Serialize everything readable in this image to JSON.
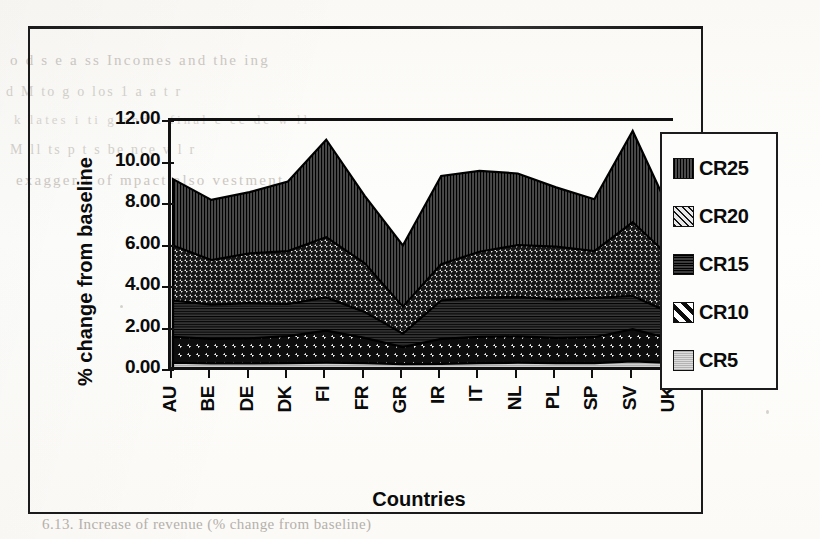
{
  "page": {
    "background_color": "#fdfdfb",
    "frame_color": "#1b1b1b",
    "caption": "6.13. Increase of revenue (% change from baseline)",
    "bleed_lines": [
      "o d s e a ss Incomes and the   ing",
      "d  M  to     g   o      los 1 a  a     t  r",
      "k  lates   i  ti g  and  t  final c ec  de  w ll",
      "M    ll    ts  p  t  s  be  nce   v   l  r",
      "exagger  t  of  mpact     also   vestment"
    ]
  },
  "chart_data": {
    "type": "area",
    "stacked": true,
    "title": "",
    "xlabel": "Countries",
    "ylabel": "% change from baseline",
    "categories": [
      "AU",
      "BE",
      "DE",
      "DK",
      "FI",
      "FR",
      "GR",
      "IR",
      "IT",
      "NL",
      "PL",
      "SP",
      "SV",
      "UK"
    ],
    "ylim": [
      0,
      12
    ],
    "yticks": [
      "0.00",
      "2.00",
      "4.00",
      "6.00",
      "8.00",
      "10.00",
      "12.00"
    ],
    "ytick_values": [
      0,
      2,
      4,
      6,
      8,
      10,
      12
    ],
    "grid": false,
    "legend_position": "right",
    "series": [
      {
        "name": "CR5",
        "color": "#c9c9c9",
        "pattern": "light-gray-dots",
        "values": [
          0.35,
          0.32,
          0.32,
          0.33,
          0.35,
          0.33,
          0.28,
          0.3,
          0.33,
          0.35,
          0.33,
          0.33,
          0.42,
          0.34
        ]
      },
      {
        "name": "CR10",
        "color": "#ffffff",
        "pattern": "bold-diagonal-stripes",
        "values": [
          1.25,
          1.18,
          1.2,
          1.3,
          1.55,
          1.22,
          0.82,
          1.2,
          1.27,
          1.27,
          1.22,
          1.25,
          1.55,
          1.15
        ]
      },
      {
        "name": "CR15",
        "color": "#2a2a2a",
        "pattern": "dark-horizontal-lines",
        "values": [
          1.75,
          1.65,
          1.7,
          1.55,
          1.6,
          1.25,
          0.65,
          1.85,
          1.9,
          1.9,
          1.85,
          1.9,
          1.6,
          1.25
        ]
      },
      {
        "name": "CR20",
        "color": "#d8d8d8",
        "pattern": "fine-diagonal-hatch",
        "values": [
          2.65,
          2.15,
          2.4,
          2.55,
          2.9,
          2.35,
          1.3,
          1.75,
          2.2,
          2.5,
          2.55,
          2.25,
          3.55,
          2.65
        ]
      },
      {
        "name": "CR25",
        "color": "#3a3a3a",
        "pattern": "dense-vertical-lines",
        "values": [
          3.2,
          2.9,
          2.95,
          3.35,
          4.7,
          3.25,
          2.95,
          4.25,
          3.9,
          3.45,
          2.85,
          2.5,
          4.4,
          2.15
        ]
      }
    ],
    "cumulative_tops": {
      "CR5": [
        0.35,
        0.32,
        0.32,
        0.33,
        0.35,
        0.33,
        0.28,
        0.3,
        0.33,
        0.35,
        0.33,
        0.33,
        0.42,
        0.34
      ],
      "CR10": [
        1.6,
        1.5,
        1.52,
        1.63,
        1.9,
        1.55,
        1.1,
        1.5,
        1.6,
        1.62,
        1.55,
        1.58,
        1.97,
        1.49
      ],
      "CR15": [
        3.35,
        3.15,
        3.22,
        3.18,
        3.5,
        2.8,
        1.75,
        3.35,
        3.5,
        3.52,
        3.4,
        3.48,
        3.57,
        2.74
      ],
      "CR20": [
        6.0,
        5.3,
        5.62,
        5.73,
        6.4,
        5.15,
        3.05,
        5.1,
        5.7,
        6.02,
        5.95,
        5.73,
        7.12,
        5.39
      ],
      "CR25": [
        9.2,
        8.2,
        8.57,
        9.08,
        11.1,
        8.4,
        6.0,
        9.35,
        9.6,
        9.47,
        8.8,
        8.23,
        11.52,
        7.54
      ]
    }
  },
  "legend": {
    "items": [
      {
        "label": "CR25",
        "swatch": "dense-vertical-lines"
      },
      {
        "label": "CR20",
        "swatch": "fine-diagonal-hatch"
      },
      {
        "label": "CR15",
        "swatch": "dark-horizontal-lines"
      },
      {
        "label": "CR10",
        "swatch": "bold-diagonal-stripes"
      },
      {
        "label": "CR5",
        "swatch": "light-gray-dots"
      }
    ]
  }
}
